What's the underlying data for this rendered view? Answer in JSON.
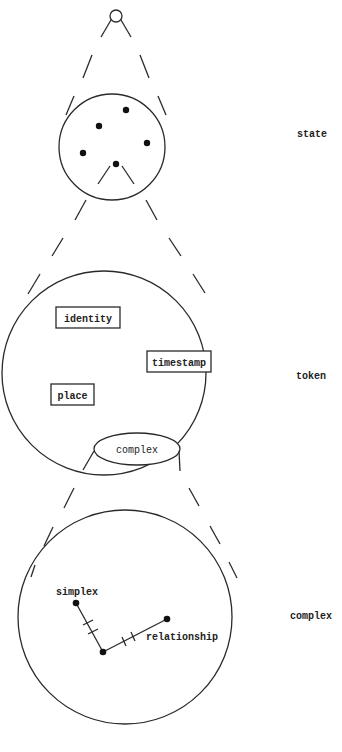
{
  "diagram": {
    "levels": [
      {
        "id": "state",
        "label": "state"
      },
      {
        "id": "token",
        "label": "token"
      },
      {
        "id": "complex",
        "label": "complex"
      }
    ],
    "state": {
      "dots": 5,
      "colors": {
        "stroke": "#2a2a2a",
        "dot": "#111111"
      }
    },
    "token": {
      "fields": {
        "identity": "identity",
        "timestamp": "timestamp",
        "place": "place",
        "complex": "complex"
      }
    },
    "complex": {
      "nodes": {
        "simplex": "simplex",
        "relationship": "relationship"
      }
    }
  }
}
